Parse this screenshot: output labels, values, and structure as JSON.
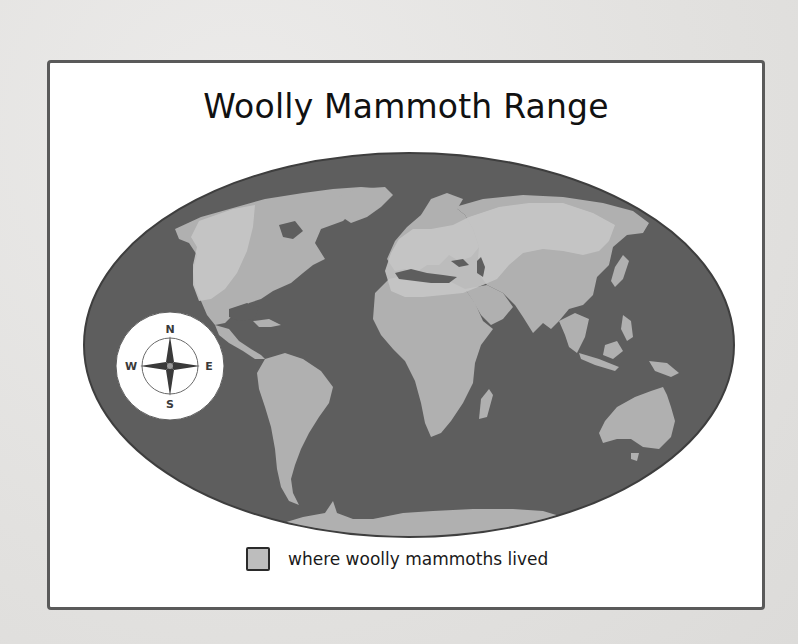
{
  "map": {
    "title": "Woolly Mammoth Range",
    "legend": {
      "label": "where woolly mammoths lived",
      "swatch_color": "#bdbdbd"
    },
    "compass": {
      "north": "N",
      "south": "S",
      "east": "E",
      "west": "W",
      "icon": "compass-rose-icon"
    },
    "colors": {
      "ocean": "#5e5e5e",
      "land": "#b0b0b0",
      "range": "#c6c6c6",
      "frame_border": "#5a5a5a",
      "page_background": "#e4e4e2"
    },
    "regions_shaded": [
      "Northern North America",
      "Northern Europe",
      "Northern Asia / Siberia"
    ]
  }
}
